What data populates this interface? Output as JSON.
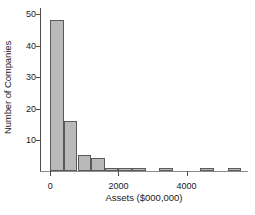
{
  "chart_data": {
    "type": "bar",
    "title": "",
    "subtitle": "",
    "xlabel": "Assets ($000,000)",
    "ylabel": "Number of Companies",
    "grid": false,
    "legend": null,
    "xlim": [
      -300,
      5800
    ],
    "ylim": [
      0,
      52
    ],
    "bin_width": 400,
    "xticks": [
      0,
      2000,
      4000
    ],
    "xtick_labels": [
      "0",
      "2000",
      "4000"
    ],
    "yticks": [
      10,
      20,
      30,
      40,
      50
    ],
    "ytick_labels": [
      "10",
      "20",
      "30",
      "40",
      "50"
    ],
    "categories": [
      "0-400",
      "400-800",
      "800-1200",
      "1200-1600",
      "1600-2000",
      "2000-2400",
      "2400-2800",
      "2800-3200",
      "3200-3600",
      "3600-4000",
      "4000-4400",
      "4400-4800",
      "4800-5200",
      "5200-5600"
    ],
    "bin_starts": [
      0,
      400,
      800,
      1200,
      1600,
      2000,
      2400,
      2800,
      3200,
      3600,
      4000,
      4400,
      4800,
      5200
    ],
    "values": [
      48,
      16,
      5,
      4,
      1,
      1,
      1,
      0,
      1,
      0,
      0,
      1,
      0,
      1
    ],
    "bar_fill_color": "#b9b9b9",
    "bar_edge_color": "#5a5a5a",
    "axis_color": "#4d4d4d",
    "text_color": "#1a1a1a",
    "background_color": "#ffffff"
  }
}
